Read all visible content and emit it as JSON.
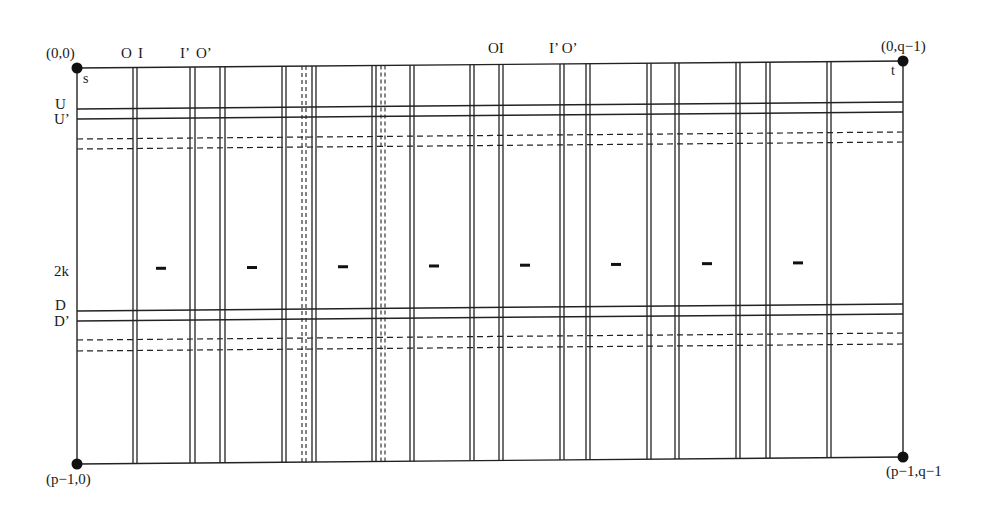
{
  "diagram": {
    "corners": {
      "top_left": "(0,0)",
      "top_right": "(0,q−1)",
      "bottom_left": "(p−1,0)",
      "bottom_right": "(p−1,q−1"
    },
    "terminals": {
      "source": "s",
      "target": "t"
    },
    "column_labels": {
      "group1": {
        "o": "O",
        "i": "I",
        "i_prime": "I’",
        "o_prime": "O’"
      },
      "group2": {
        "oi": "OI",
        "i_prime_o_prime": "I’ O’"
      }
    },
    "row_labels": {
      "u": "U",
      "u_prime": "U’",
      "two_k": "2k",
      "d": "D",
      "d_prime": "D’"
    },
    "dash_marks_count": 8,
    "line_color": "#222222",
    "background": "#ffffff"
  }
}
